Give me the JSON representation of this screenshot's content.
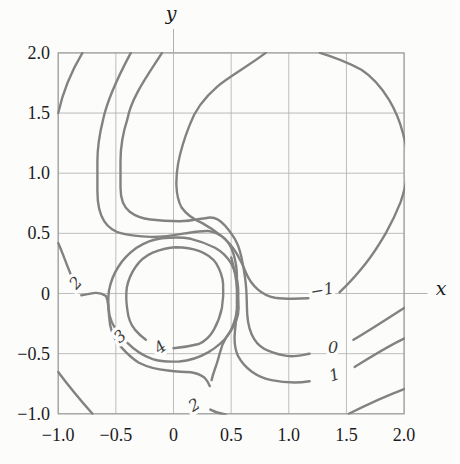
{
  "figure": {
    "x_axis_letter": "x",
    "y_axis_letter": "y"
  },
  "chart_data": {
    "type": "contour",
    "title": "",
    "xlabel": "x",
    "ylabel": "y",
    "xlim": [
      -1.0,
      2.0
    ],
    "ylim": [
      -1.0,
      2.0
    ],
    "grid": true,
    "grid_step": 0.5,
    "levels": [
      -1,
      0,
      1,
      2,
      3,
      4
    ],
    "x_ticks": [
      {
        "v": -1.0,
        "label": "−1.0"
      },
      {
        "v": -0.5,
        "label": "−0.5"
      },
      {
        "v": 0,
        "label": "0"
      },
      {
        "v": 0.5,
        "label": "0.5"
      },
      {
        "v": 1.0,
        "label": "1.0"
      },
      {
        "v": 1.5,
        "label": "1.5"
      },
      {
        "v": 2.0,
        "label": "2.0"
      }
    ],
    "y_ticks": [
      {
        "v": 2.0,
        "label": "2.0"
      },
      {
        "v": 1.5,
        "label": "1.5"
      },
      {
        "v": 1.0,
        "label": "1.0"
      },
      {
        "v": 0.5,
        "label": "0.5"
      },
      {
        "v": 0,
        "label": "0"
      },
      {
        "v": -0.5,
        "label": "−0.5"
      },
      {
        "v": -1.0,
        "label": "−1.0"
      }
    ],
    "contour_labels": [
      {
        "text": "2",
        "level": 2,
        "x": -0.85,
        "y": 0.09,
        "rotation": -48
      },
      {
        "text": "3",
        "level": 3,
        "x": -0.465,
        "y": -0.355,
        "rotation": -42
      },
      {
        "text": "4",
        "level": 4,
        "x": -0.115,
        "y": -0.445,
        "rotation": -38
      },
      {
        "text": "2",
        "level": 2,
        "x": 0.18,
        "y": -0.925,
        "rotation": -32
      },
      {
        "text": "−1",
        "level": -1,
        "x": 1.29,
        "y": 0.03,
        "rotation": -10
      },
      {
        "text": "0",
        "level": 0,
        "x": 1.385,
        "y": -0.445,
        "rotation": 0
      },
      {
        "text": "1",
        "level": 1,
        "x": 1.395,
        "y": -0.675,
        "rotation": -18
      }
    ],
    "contours": [
      {
        "level": 2,
        "name": "level-2-top-left-arc",
        "subpaths": [
          "M82.4 52.9Q65.1 81.8 58.2 113.1"
        ]
      },
      {
        "level": 1,
        "name": "level-1-curve",
        "subpaths": [
          "M130.8 52.9C119 75 108 97 103.2 119.1C99.5 134 97.4 148 97.4 161.2C97.4 171 97.4 181 97.4 191.2C97.4 203 99.5 214 104.3 221.3C109 228.5 114.5 231.5 121.6 233.4C130 235.5 140 236.5 150.4 236.9C162 237.3 174 235.3 185 233.4C193 232.2 201 230.8 208.1 231C215 231.8 220 234.5 224.2 238.2C228.5 242 231.5 247.5 233.5 253.8C235.5 260.5 236.9 268 236.9 275.5C236.9 285 236.9 295 236.9 305.5C236.9 315 235.3 326 234.6 335.6C234.3 344 235.6 351 238.1 356.1C241 361.5 245.8 367.3 251.9 371.7C258 376 264.4 378.7 271.5 380.1C279 381.5 287 382.3 294.6 382.5C300 382.5 305 382 309.6 381.3",
          "M354.6 366.9C370 357.5 389 345.5 404.1 338.6"
        ]
      },
      {
        "level": 0,
        "name": "level-0-curve",
        "subpaths": [
          "M162 52.9C148 75 131.5 97 127.4 119.1C122.5 134 120.5 148 120.5 161.2C120.5 172 120.5 180 120.5 187.6C120.5 199 123.5 207 129.7 211.7C136.5 216.8 143 218.6 150.4 219.5C160 220.7 170 221.2 179.3 221.3C189 221.4 199.5 219 208.1 217.7C214.5 216.7 220.5 220.3 225.4 226.1C230 231.5 233.8 236.5 236.9 243C239.8 249 241.3 256 242.7 263.4C244.3 272 245.5 279.5 246.1 287.5C246.9 297 246.7 306.5 247.3 315.2C248 325 250 332.5 254.2 339.2C257.5 344.5 262 348.3 268 350.6C274.5 353.2 281.5 355.3 288.8 356.1C296 356.8 303 354.8 309.6 353.7",
          "M353.4 339.8C370 330 390 317 404.1 307.9"
        ]
      },
      {
        "level": -1,
        "name": "level-neg1-circle",
        "subpaths": [
          "M265.7 52.9C247 67 229 76.5 217.3 86.6C203.5 98.5 194.5 111 189.6 125.1C184.5 138 180.5 150.5 178.1 163.6C176.8 171 176.2 178 176.4 185.2C176.7 193.5 178 201 181.6 207.5C186.5 214.5 193.5 219.4 202.3 223.1C209.5 227 216 231.6 221.9 236.4C227.5 241 232.8 247 236.9 253.8C240.5 260 243.6 266.5 246.1 273C249 280 252.8 285 257.7 289.3C263 294 268.5 296.5 275 297.7C286 299.2 297.5 298.8 308.4 298.3",
          "M339.5 292.3C348.5 284 357 274.5 364.9 264.6C372.5 255 379.5 244 385.7 233.4C391.5 223 396.5 212.5 400.6 202.1C404 192 406.5 182.5 407.6 173.2",
          "M319.9 52.9C334 57 348.5 63 361.4 69.7C372 76.5 381.5 87.5 389.1 99.8C395.5 110.5 400 121.5 403 133.5C405.5 143 407.8 152 408.7 161.2"
        ]
      },
      {
        "level": 3,
        "name": "level-3-ring",
        "subpaths": [
          "M127.4 342.8C135 350.5 143.5 355.8 152.7 359.1C161.5 362 170.5 361.9 179.3 361.5C189.5 360.8 199.5 357.3 208.1 352.4C216 347.6 222.8 342.2 227.7 335.6C232.5 328.5 235.3 320 236.9 311.5C238.4 303.5 238.5 295.5 238.1 287.5C237.6 279 234.9 270.8 231.2 263.4C227 256.5 221.6 251.5 215 247.8C207.5 243.9 199.5 240.8 190.8 238.8C181 236.8 171.5 237.4 162 238.2C152.5 239.3 144 242.9 136.6 247.8C128.8 253.3 122.7 259.7 118.2 267C113.4 274.5 110.4 282.5 108.9 291.1C107.8 299.5 108.3 307.5 109.5 315.2C110.8 320.5 113 325.5 115.9 329.6"
        ]
      },
      {
        "level": 4,
        "name": "level-4-ring",
        "subpaths": [
          "M173.5 348.2C182 347.5 191 346 198.9 344C205.5 341 210.5 335.8 213.9 329.6C217.5 323 220.3 315.8 221.9 307.9C223.3 300 223.6 291.8 223.1 283.9C222.6 276.5 219.8 269.5 216.2 263.4C212.3 257.3 206 253.5 198.9 250.8C191.5 248.2 183.5 247.3 175.8 247.2C168 247.4 160 249.7 152.7 252.6C145.5 255.8 139.5 261 135.5 267C131.3 273 128.3 280 126.8 287.5C125.8 295.5 126.3 303.3 127.4 310.3C128.2 317.5 131 324.8 134.9 329.6C137.8 333 141.5 336.8 145.8 339.8"
        ]
      },
      {
        "level": 2,
        "name": "level-2-sweep",
        "subpaths": [
          "M58.2 243C62.5 252.5 67.5 267 71.5 276.1",
          "M81.3 295.3C85.5 294.8 90.5 293.4 95.1 292.9C99.5 292.6 103 294 106 295.9C107.6 299.5 108.1 303.5 108.4 307.9C108.8 313.5 109.4 319.3 110.1 324.8C111.5 332.5 115 340.5 120.5 346.4C125.5 352 131.5 358.3 138.9 362.7C147.5 367 157.5 369.5 167.7 370.5C175.5 371.3 183.5 372 190.8 372.3C196 372.9 200.5 374.8 204.6 377.7C207.2 380.5 208.8 383 209.8 386.1",
          "M231.2 257.4C233.5 265 235.3 273 236.3 281.5C237.2 290.5 238.3 299.5 238.6 307.9C238.8 318.5 233 329 226.5 336.8C222.5 343 220.8 348.5 219.6 353.7C218.3 359.5 216.2 365.3 214.4 370.5C213.2 374 212.3 377.3 211.6 380.1",
          "M210.4 409.6Q217 413.3 225.5 414.5"
        ]
      },
      {
        "level": 2,
        "name": "level-2-bottom-right-arc",
        "subpaths": [
          "M348.8 413.8Q378.7 398.7 404.1 389.1"
        ]
      },
      {
        "level": 1,
        "name": "level-1-bottom-left-arc",
        "subpaths": [
          "M58.2 372Q73.2 392.1 92.5 413.8"
        ]
      }
    ],
    "colors": {
      "contour": "#828282",
      "grid": "#b5b5b5",
      "frame": "#9c9c9c",
      "tick_text": "#1b1b1b",
      "contour_label_text": "#3b3b3b",
      "background": "#fcfcfb"
    }
  }
}
